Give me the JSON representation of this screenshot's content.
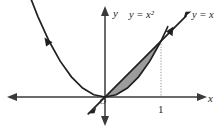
{
  "figure": {
    "background_color": "#ffffff",
    "axes": {
      "x_axis_label": "x",
      "y_axis_label": "y",
      "origin_label": "O",
      "axis_color": "#3a3a3a",
      "x_ticks": [
        {
          "label": "1",
          "value": 1
        }
      ]
    },
    "curves": [
      {
        "name": "parabola",
        "label": "y = x²",
        "equation": "y = x^2",
        "color": "#231f20",
        "arrow_ends": [
          "left-up",
          "right-up"
        ]
      },
      {
        "name": "line",
        "label": "y = x",
        "equation": "y = x",
        "color": "#231f20",
        "arrow_ends": [
          "left-down",
          "right-up"
        ]
      }
    ],
    "shaded_region": {
      "name": "area-between-curves",
      "fill_color": "#9c9c9c",
      "upper_boundary": "y = x",
      "lower_boundary": "y = x²",
      "x_from": 0,
      "x_to": 1
    },
    "guide_line": {
      "name": "vertical-dotted-guide",
      "at_x": 1,
      "color": "#8d8d8d",
      "style": "dotted"
    }
  },
  "chart_data": {
    "type": "line",
    "title": "",
    "xlabel": "x",
    "ylabel": "y",
    "xlim": [
      -1.9,
      2.1
    ],
    "ylim": [
      -0.55,
      1.5
    ],
    "grid": false,
    "legend": "inline-curve-labels",
    "annotations": [
      {
        "text": "y = x²",
        "x": 0.45,
        "y": 1.42
      },
      {
        "text": "y = x",
        "x": 1.65,
        "y": 1.42
      },
      {
        "text": "1",
        "x": 1.0,
        "y": -0.22
      },
      {
        "text": "O",
        "x": -0.04,
        "y": -0.03
      }
    ],
    "series": [
      {
        "name": "y = x²",
        "x": [
          -1.35,
          -1.2,
          -1.0,
          -0.8,
          -0.6,
          -0.4,
          -0.2,
          0,
          0.2,
          0.4,
          0.6,
          0.8,
          1.0,
          1.12
        ],
        "values": [
          1.8225,
          1.44,
          1.0,
          0.64,
          0.36,
          0.16,
          0.04,
          0,
          0.04,
          0.16,
          0.36,
          0.64,
          1.0,
          1.2544
        ]
      },
      {
        "name": "y = x",
        "x": [
          -0.3,
          0,
          0.5,
          1.0,
          1.45
        ],
        "values": [
          -0.3,
          0,
          0.5,
          1.0,
          1.45
        ]
      }
    ],
    "shaded_between": {
      "upper": "y = x",
      "lower": "y = x²",
      "x_range": [
        0,
        1
      ],
      "color": "#9c9c9c"
    }
  }
}
